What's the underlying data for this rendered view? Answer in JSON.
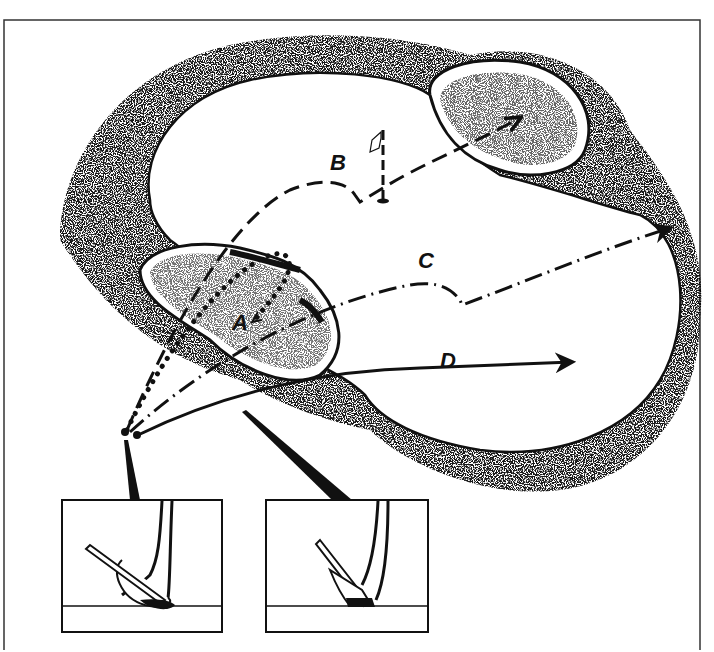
{
  "figure": {
    "type": "illustration",
    "colors": {
      "ink": "#111111",
      "background": "#ffffff",
      "frame": "#333333"
    }
  },
  "labels": {
    "a": "A",
    "b": "B",
    "c": "C",
    "d": "D"
  },
  "shots": [
    {
      "id": "A",
      "style": "dotted",
      "description": "high lob landing short in bunker"
    },
    {
      "id": "B",
      "style": "dashed",
      "description": "carry over bunker, bounce near flag, roll to far bunker"
    },
    {
      "id": "C",
      "style": "dash-dot",
      "description": "lower shot, bounces then runs long"
    },
    {
      "id": "D",
      "style": "solid",
      "description": "low running shot"
    }
  ],
  "insets": [
    {
      "id": "open-face",
      "description": "club face laid open, sole entering sand"
    },
    {
      "id": "square-face",
      "description": "club face square, leading edge digging"
    }
  ]
}
